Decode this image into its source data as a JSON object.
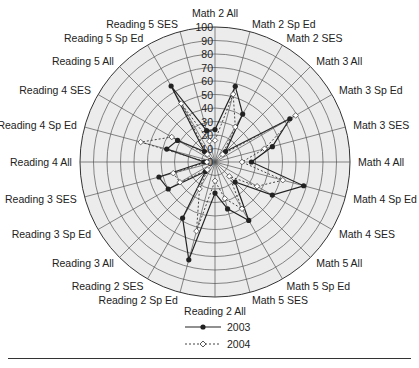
{
  "chart_data": {
    "type": "radar",
    "title": "",
    "axes": [
      "Math 2 All",
      "Math 2 Sp Ed",
      "Math 2 SES",
      "Math 3 All",
      "Math 3 Sp Ed",
      "Math 3 SES",
      "Math 4 All",
      "Math 4 Sp Ed",
      "Math 4 SES",
      "Math 5 All",
      "Math 5 Sp Ed",
      "Math 5 SES",
      "Reading 2 All",
      "Reading 2 Sp Ed",
      "Reading 2 SES",
      "Reading 3 All",
      "Reading 3 Sp Ed",
      "Reading 3 SES",
      "Reading 4 All",
      "Reading 4 Sp Ed",
      "Reading 4 SES",
      "Reading 5 All",
      "Reading 5 Sp Ed",
      "Reading 5 SES"
    ],
    "radial_ticks": [
      0,
      10,
      20,
      30,
      40,
      50,
      60,
      70,
      80,
      90,
      100
    ],
    "rlim": [
      0,
      100
    ],
    "grid": true,
    "legend_position": "bottom",
    "series": [
      {
        "name": "2003",
        "style": "solid-filled-circle",
        "color": "#222222",
        "values": [
          24,
          58,
          41,
          11,
          64,
          44,
          27,
          68,
          49,
          21,
          50,
          36,
          23,
          75,
          48,
          10,
          40,
          43,
          8,
          37,
          32,
          11,
          65,
          24
        ]
      },
      {
        "name": "2004",
        "style": "dashed-open-diamond",
        "color": "#444444",
        "values": [
          16,
          52,
          30,
          8,
          69,
          38,
          20,
          52,
          36,
          15,
          40,
          28,
          14,
          53,
          23,
          8,
          30,
          32,
          6,
          57,
          37,
          8,
          50,
          16
        ]
      }
    ]
  },
  "legend": {
    "items": [
      {
        "label": "2003"
      },
      {
        "label": "2004"
      }
    ]
  }
}
